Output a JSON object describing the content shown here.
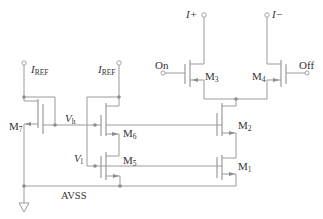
{
  "diagram": {
    "type": "circuit-schematic",
    "labels": {
      "iref_left": {
        "main": "I",
        "sub": "REF"
      },
      "iref_right": {
        "main": "I",
        "sub": "REF"
      },
      "i_plus": "I+",
      "i_minus": "I−",
      "on": "On",
      "off": "Off",
      "vh": {
        "main": "V",
        "sub": "h"
      },
      "vl": {
        "main": "V",
        "sub": "l"
      },
      "avss": "AVSS",
      "m1": {
        "main": "M",
        "sub": "1"
      },
      "m2": {
        "main": "M",
        "sub": "2"
      },
      "m3": {
        "main": "M",
        "sub": "3"
      },
      "m4": {
        "main": "M",
        "sub": "4"
      },
      "m5": {
        "main": "M",
        "sub": "5"
      },
      "m6": {
        "main": "M",
        "sub": "6"
      },
      "m7": {
        "main": "M",
        "sub": "7"
      }
    },
    "colors": {
      "wire": "#9a9a9a",
      "node": "#8c8c8c",
      "text": "#333333"
    }
  }
}
